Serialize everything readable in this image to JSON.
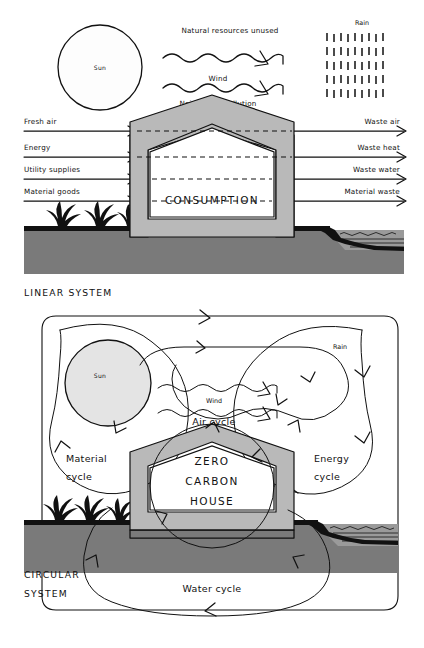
{
  "diagram": {
    "panels": [
      {
        "id": "linear",
        "caption": "LINEAR SYSTEM",
        "house_label": "CONSUMPTION",
        "sun_label": "Sun",
        "rain_label": "Rain",
        "wind_label": "Wind",
        "top_label": "Natural resources unused",
        "pollution_label": "Noise & air pollution",
        "inputs": [
          "Fresh air",
          "Energy",
          "Utility supplies",
          "Material goods"
        ],
        "outputs": [
          "Waste air",
          "Waste heat",
          "Waste water",
          "Material waste"
        ]
      },
      {
        "id": "circular",
        "caption_line1": "CIRCULAR",
        "caption_line2": "SYSTEM",
        "house_label_line1": "ZERO",
        "house_label_line2": "CARBON",
        "house_label_line3": "HOUSE",
        "sun_label": "Sun",
        "rain_label": "Rain",
        "wind_label": "Wind",
        "cycles": [
          {
            "id": "air",
            "line1": "Air cycle",
            "line2": ""
          },
          {
            "id": "material",
            "line1": "Material",
            "line2": "cycle"
          },
          {
            "id": "energy",
            "line1": "Energy",
            "line2": "cycle"
          },
          {
            "id": "water",
            "line1": "Water cycle",
            "line2": ""
          }
        ]
      }
    ],
    "colors": {
      "ink": "#111111",
      "ground": "#7a7a7a",
      "wall": "#b9b9b9",
      "water": "#9a9a9a",
      "sun_linear": "#fdfdfd",
      "sun_circular": "#e4e4e4",
      "paper": "#ffffff"
    }
  }
}
